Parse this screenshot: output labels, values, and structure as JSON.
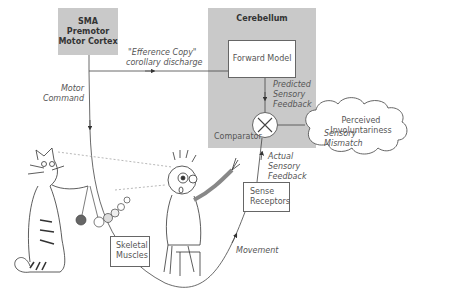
{
  "diagram": {
    "sma_box": {
      "lines": [
        "SMA",
        "Premotor",
        "Motor Cortex"
      ]
    },
    "cerebellum": {
      "title": "Cerebellum"
    },
    "forward_model": {
      "label": "Forward Model"
    },
    "comparator": {
      "label": "Comparator",
      "symbol": "×"
    },
    "perceived": {
      "lines": [
        "Perceived",
        "Involuntariness"
      ]
    },
    "sense_receptors": {
      "lines": [
        "Sense",
        "Receptors"
      ]
    },
    "skeletal_muscles": {
      "lines": [
        "Skeletal",
        "Muscles"
      ]
    },
    "edges": {
      "efference_copy": {
        "lines": [
          "\"Efference Copy\"",
          "corollary discharge"
        ]
      },
      "motor_command": {
        "lines": [
          "Motor",
          "Command"
        ]
      },
      "predicted_feedback": {
        "lines": [
          "Predicted",
          "Sensory",
          "Feedback"
        ]
      },
      "sensory_mismatch": {
        "lines": [
          "Sensory",
          "Mismatch"
        ]
      },
      "actual_feedback": {
        "lines": [
          "Actual",
          "Sensory",
          "Feedback"
        ]
      },
      "movement": {
        "label": "Movement"
      }
    },
    "colors": {
      "gray_panel": "#c9c9c9",
      "line": "#444444"
    }
  }
}
